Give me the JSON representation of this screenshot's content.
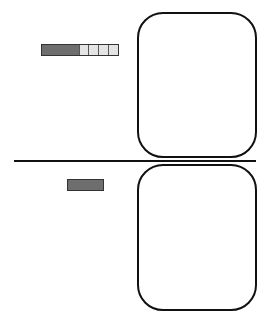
{
  "diagram": {
    "top_panel": {
      "meter": {
        "filled_segments": 1,
        "empty_cells": 4,
        "filled_color": "#6e6e6e",
        "empty_color": "#e4e4e4"
      },
      "box": {
        "shape": "rounded-rectangle"
      }
    },
    "divider": {
      "orientation": "horizontal"
    },
    "bottom_panel": {
      "bar": {
        "color": "#6e6e6e"
      },
      "box": {
        "shape": "rounded-rectangle"
      }
    }
  }
}
